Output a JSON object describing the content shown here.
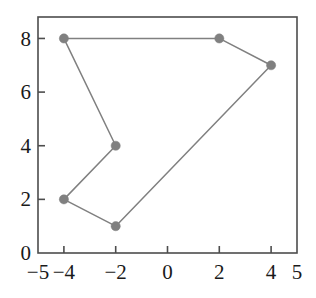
{
  "chart_data": {
    "type": "line",
    "title": "",
    "xlabel": "",
    "ylabel": "",
    "xlim": [
      -5,
      5
    ],
    "ylim": [
      0,
      8.8
    ],
    "grid": false,
    "legend": null,
    "closed_path": true,
    "marker": "filled-circle",
    "series": [
      {
        "name": "polygon",
        "color": "#808080",
        "points": [
          {
            "x": -4,
            "y": 8
          },
          {
            "x": 2,
            "y": 8
          },
          {
            "x": 4,
            "y": 7
          },
          {
            "x": -2,
            "y": 1
          },
          {
            "x": -4,
            "y": 2
          },
          {
            "x": -2,
            "y": 4
          },
          {
            "x": -4,
            "y": 8
          }
        ]
      }
    ],
    "xticks": [
      {
        "value": -4,
        "label": "−4"
      },
      {
        "value": -2,
        "label": "−2"
      },
      {
        "value": 0,
        "label": "0"
      },
      {
        "value": 2,
        "label": "2"
      },
      {
        "value": 4,
        "label": "4"
      }
    ],
    "x_edge_labels": [
      {
        "value": -5,
        "label": "−5"
      },
      {
        "value": 5,
        "label": "5"
      }
    ],
    "yticks": [
      {
        "value": 2,
        "label": "2"
      },
      {
        "value": 4,
        "label": "4"
      },
      {
        "value": 6,
        "label": "6"
      },
      {
        "value": 8,
        "label": "8"
      }
    ],
    "y_edge_labels": [
      {
        "value": 0,
        "label": "0"
      }
    ]
  },
  "style": {
    "axis_color": "#4d4d4d",
    "data_color": "#808080",
    "text_color": "#1a1a1a",
    "background": "#ffffff"
  }
}
